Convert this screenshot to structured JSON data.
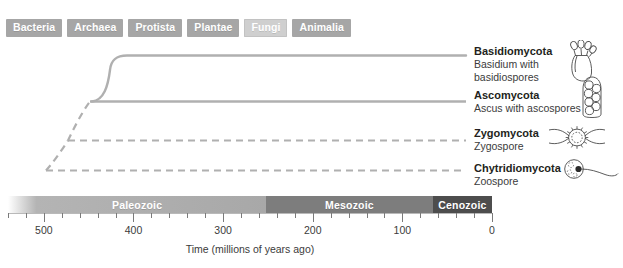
{
  "taxa": {
    "items": [
      {
        "label": "Bacteria",
        "name": "taxon-chip-bacteria",
        "selected": false
      },
      {
        "label": "Archaea",
        "name": "taxon-chip-archaea",
        "selected": false
      },
      {
        "label": "Protista",
        "name": "taxon-chip-protista",
        "selected": false
      },
      {
        "label": "Plantae",
        "name": "taxon-chip-plantae",
        "selected": false
      },
      {
        "label": "Fungi",
        "name": "taxon-chip-fungi",
        "selected": true
      },
      {
        "label": "Animalia",
        "name": "taxon-chip-animalia",
        "selected": false
      }
    ]
  },
  "leaves": [
    {
      "name": "Basidiomycota",
      "desc_line1": "Basidium with",
      "desc_line2": "basidiospores",
      "art": "basidium-illustration"
    },
    {
      "name": "Ascomycota",
      "desc_line1": "Ascus with ascospores",
      "desc_line2": "",
      "art": "ascus-illustration"
    },
    {
      "name": "Zygomycota",
      "desc_line1": "Zygospore",
      "desc_line2": "",
      "art": "zygospore-illustration"
    },
    {
      "name": "Chytridiomycota",
      "desc_line1": "Zoospore",
      "desc_line2": "",
      "art": "zoospore-illustration"
    }
  ],
  "timeline": {
    "eras": [
      {
        "label": "Paleozoic",
        "start_mya": 541,
        "end_mya": 252,
        "color": "#a8a8a8"
      },
      {
        "label": "Mesozoic",
        "start_mya": 252,
        "end_mya": 66,
        "color": "#7d7d7d"
      },
      {
        "label": "Cenozoic",
        "start_mya": 66,
        "end_mya": 0,
        "color": "#4d4d4d"
      }
    ],
    "axis_caption": "Time (millions of years ago)",
    "major_ticks": [
      500,
      400,
      300,
      200,
      100,
      0
    ],
    "tick_interval_mya": 20,
    "axis_min_mya": 0,
    "axis_max_mya": 540
  },
  "chart_data": {
    "type": "line",
    "xlabel": "Time (millions of years ago)",
    "ylabel": "",
    "xlim": [
      540,
      0
    ],
    "x_reversed": true,
    "grid": false,
    "legend": "none",
    "branch_style_note": "dashed = inferred/uncertain divergence, solid = well supported",
    "nodes": [
      {
        "id": "root",
        "divergence_mya": 520,
        "style": "dashed"
      },
      {
        "id": "chytrid-split",
        "divergence_mya": 520,
        "style": "dashed"
      },
      {
        "id": "zygo-split",
        "divergence_mya": 480,
        "style": "dashed"
      },
      {
        "id": "dikarya-split",
        "divergence_mya": 450,
        "style": "dashed"
      },
      {
        "id": "basidio-asco",
        "divergence_mya": 420,
        "style": "solid"
      }
    ],
    "series": [
      {
        "name": "Chytridiomycota",
        "origin_mya": 520,
        "end_mya": 0,
        "style": "dashed"
      },
      {
        "name": "Zygomycota",
        "origin_mya": 480,
        "end_mya": 0,
        "style": "dashed"
      },
      {
        "name": "Ascomycota",
        "origin_mya": 420,
        "end_mya": 0,
        "style": "solid"
      },
      {
        "name": "Basidiomycota",
        "origin_mya": 420,
        "end_mya": 0,
        "style": "solid"
      }
    ]
  }
}
